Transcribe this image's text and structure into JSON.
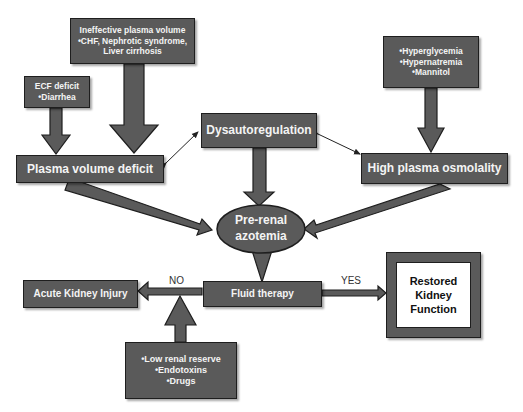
{
  "nodes": {
    "ineffective": {
      "lines": [
        "Ineffective plasma volume",
        "•CHF, Nephrotic syndrome,",
        "Liver cirrhosis"
      ]
    },
    "ecf": {
      "lines": [
        "ECF deficit",
        "•Diarrhea"
      ]
    },
    "osmotic_causes": {
      "lines": [
        "•Hyperglycemia",
        "•Hypernatremia",
        "•Mannitol"
      ]
    },
    "dysautoregulation": {
      "label": "Dysautoregulation"
    },
    "plasma_volume_deficit": {
      "label": "Plasma volume deficit"
    },
    "high_plasma_osmolality": {
      "label": "High plasma osmolality"
    },
    "prerenal_azotemia": {
      "lines": [
        "Pre-renal",
        "azotemia"
      ]
    },
    "acute_kidney_injury": {
      "label": "Acute Kidney Injury"
    },
    "fluid_therapy": {
      "label": "Fluid therapy"
    },
    "restored": {
      "lines": [
        "Restored",
        "Kidney",
        "Function"
      ]
    },
    "risk_factors": {
      "lines": [
        "•Low renal reserve",
        "•Endotoxins",
        "•Drugs"
      ]
    }
  },
  "edges": {
    "no_label": "NO",
    "yes_label": "YES"
  },
  "colors": {
    "box_fill": "#5a5a5a",
    "border": "#1e1e1e",
    "text": "#f4f4f4"
  }
}
